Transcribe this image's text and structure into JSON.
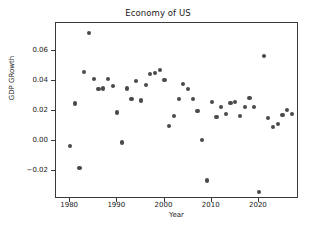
{
  "chart_data": {
    "type": "scatter",
    "title": "Economy of US",
    "xlabel": "Year",
    "ylabel": "GDP GRowth",
    "xlim": [
      1977.0,
      2028.5
    ],
    "ylim": [
      -0.0385,
      0.0785
    ],
    "grid": false,
    "legend": null,
    "marker_color": "#4a4a4a",
    "xticks": [
      1980,
      1990,
      2000,
      2010,
      2020
    ],
    "xtick_labels": [
      "1980",
      "1990",
      "2000",
      "2010",
      "2020"
    ],
    "yticks": [
      -0.02,
      0.0,
      0.02,
      0.04,
      0.06
    ],
    "ytick_labels": [
      "−0.02",
      "0.00",
      "0.02",
      "0.04",
      "0.06"
    ],
    "x": [
      1980,
      1981,
      1982,
      1983,
      1984,
      1985,
      1986,
      1987,
      1988,
      1989,
      1990,
      1991,
      1992,
      1993,
      1994,
      1995,
      1996,
      1997,
      1998,
      1999,
      2000,
      2001,
      2002,
      2003,
      2004,
      2005,
      2006,
      2007,
      2008,
      2009,
      2010,
      2011,
      2012,
      2013,
      2014,
      2015,
      2016,
      2017,
      2018,
      2019,
      2020,
      2021,
      2022,
      2023,
      2024,
      2025,
      2026,
      2027
    ],
    "y": [
      -0.003,
      0.025,
      -0.018,
      0.046,
      0.072,
      0.0415,
      0.0345,
      0.035,
      0.0415,
      0.0365,
      0.019,
      -0.001,
      0.035,
      0.028,
      0.04,
      0.027,
      0.0375,
      0.0445,
      0.0455,
      0.0475,
      0.0408,
      0.0098,
      0.0168,
      0.028,
      0.038,
      0.0348,
      0.028,
      0.0198,
      0.0008,
      -0.0262,
      0.0262,
      0.016,
      0.0228,
      0.0178,
      0.0255,
      0.0262,
      0.0168,
      0.0228,
      0.0288,
      0.0228,
      -0.0338,
      0.0565,
      0.0155,
      0.0095,
      0.0112,
      0.0172,
      0.0205,
      0.0182
    ],
    "series": [
      {
        "name": "GDP Growth",
        "points": [
          {
            "x": 1980,
            "y": -0.003
          },
          {
            "x": 1981,
            "y": 0.025
          },
          {
            "x": 1982,
            "y": -0.018
          },
          {
            "x": 1983,
            "y": 0.046
          },
          {
            "x": 1984,
            "y": 0.072
          },
          {
            "x": 1985,
            "y": 0.0415
          },
          {
            "x": 1986,
            "y": 0.0345
          },
          {
            "x": 1987,
            "y": 0.035
          },
          {
            "x": 1988,
            "y": 0.0415
          },
          {
            "x": 1989,
            "y": 0.0365
          },
          {
            "x": 1990,
            "y": 0.019
          },
          {
            "x": 1991,
            "y": -0.001
          },
          {
            "x": 1992,
            "y": 0.035
          },
          {
            "x": 1993,
            "y": 0.028
          },
          {
            "x": 1994,
            "y": 0.04
          },
          {
            "x": 1995,
            "y": 0.027
          },
          {
            "x": 1996,
            "y": 0.0375
          },
          {
            "x": 1997,
            "y": 0.0445
          },
          {
            "x": 1998,
            "y": 0.0455
          },
          {
            "x": 1999,
            "y": 0.0475
          },
          {
            "x": 2000,
            "y": 0.0408
          },
          {
            "x": 2001,
            "y": 0.0098
          },
          {
            "x": 2002,
            "y": 0.0168
          },
          {
            "x": 2003,
            "y": 0.028
          },
          {
            "x": 2004,
            "y": 0.038
          },
          {
            "x": 2005,
            "y": 0.0348
          },
          {
            "x": 2006,
            "y": 0.028
          },
          {
            "x": 2007,
            "y": 0.0198
          },
          {
            "x": 2008,
            "y": 0.0008
          },
          {
            "x": 2009,
            "y": -0.0262
          },
          {
            "x": 2010,
            "y": 0.0262
          },
          {
            "x": 2011,
            "y": 0.016
          },
          {
            "x": 2012,
            "y": 0.0228
          },
          {
            "x": 2013,
            "y": 0.0178
          },
          {
            "x": 2014,
            "y": 0.0255
          },
          {
            "x": 2015,
            "y": 0.0262
          },
          {
            "x": 2016,
            "y": 0.0168
          },
          {
            "x": 2017,
            "y": 0.0228
          },
          {
            "x": 2018,
            "y": 0.0288
          },
          {
            "x": 2019,
            "y": 0.0228
          },
          {
            "x": 2020,
            "y": -0.0338
          },
          {
            "x": 2021,
            "y": 0.0565
          },
          {
            "x": 2022,
            "y": 0.0155
          },
          {
            "x": 2023,
            "y": 0.0095
          },
          {
            "x": 2024,
            "y": 0.0112
          },
          {
            "x": 2025,
            "y": 0.0172
          },
          {
            "x": 2026,
            "y": 0.0205
          },
          {
            "x": 2027,
            "y": 0.0182
          }
        ]
      }
    ]
  }
}
